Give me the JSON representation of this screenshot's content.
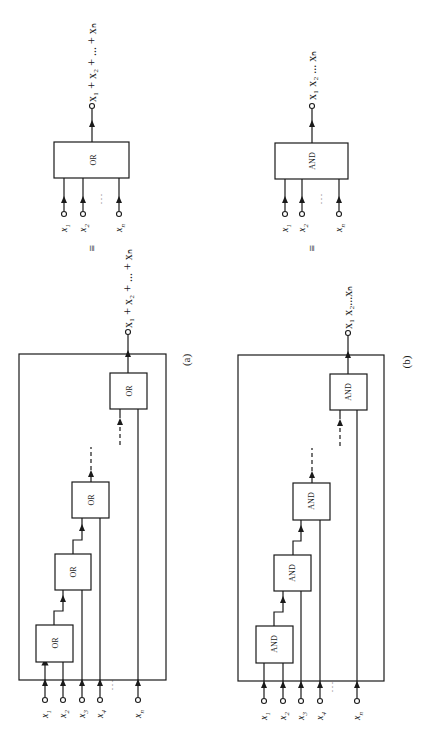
{
  "figure": {
    "orientation": "rotated-90-ccw",
    "panel_a": {
      "caption": "(a)",
      "gate_label": "OR",
      "inputs": [
        "x1",
        "x2",
        "x3",
        "x4",
        "xn"
      ],
      "input_labels": {
        "x1": "x",
        "x1_sub": "1",
        "x2": "x",
        "x2_sub": "2",
        "x3": "x",
        "x3_sub": "3",
        "x4": "x",
        "x4_sub": "4",
        "xn": "x",
        "xn_sub": "n"
      },
      "ellipsis": ". . .",
      "output": "x1 + x2 + ... + xn",
      "gates": [
        "OR",
        "OR",
        "OR",
        "OR"
      ]
    },
    "panel_b": {
      "caption": "(b)",
      "gate_label": "AND",
      "inputs": [
        "x1",
        "x2",
        "x3",
        "x4",
        "xn"
      ],
      "ellipsis": ". . .",
      "output": "x1 x2 ... xn",
      "gates": [
        "AND",
        "AND",
        "AND",
        "AND"
      ]
    },
    "equivalent_or": {
      "gate_label": "OR",
      "inputs": [
        "x1",
        "x2",
        "xn"
      ],
      "output": "x1 + x2 + ... + xn",
      "equiv_symbol": "≡"
    },
    "equivalent_and": {
      "gate_label": "AND",
      "inputs": [
        "x1",
        "x2",
        "xn"
      ],
      "output": "x1 x2 ... xn",
      "equiv_symbol": "≡"
    }
  },
  "text": {
    "or": "OR",
    "and": "AND",
    "cap_a": "(a)",
    "cap_b": "(b)",
    "equiv": "≡",
    "x": "x",
    "s1": "1",
    "s2": "2",
    "s3": "3",
    "s4": "4",
    "sn": "n",
    "dots": ". . .",
    "plus": "+",
    "ell": "...",
    "sum_full": "x₁ + x₂ + ... + xₙ",
    "prod_full": "x₁ x₂ ... xₙ",
    "prod_full_b": "x₁ x₂...xₙ"
  }
}
